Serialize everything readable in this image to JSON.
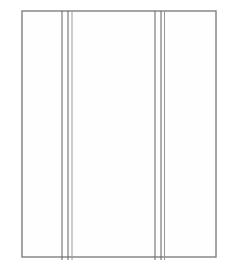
{
  "figure": {
    "background_color": "#ffffff",
    "width": 230,
    "height": 270
  },
  "palette": {
    "outline_stroke": "#7f7f7f",
    "seam_stroke": "#6e6e6e",
    "seam_stroke_soft": "#9a9a9a",
    "panel_fill": "#fefefe"
  },
  "outline": {
    "name": "panel-border",
    "x": 22,
    "y": 11,
    "width": 194,
    "height": 246,
    "stroke_width": 1.4
  },
  "seam_groups": [
    {
      "name": "left-seam-group",
      "label": "left",
      "lines": [
        {
          "x": 62.0,
          "y1": 11,
          "y2": 260,
          "weight": "strong"
        },
        {
          "x": 68.0,
          "y1": 11,
          "y2": 260,
          "weight": "strong"
        },
        {
          "x": 72.0,
          "y1": 11,
          "y2": 260,
          "weight": "soft"
        }
      ]
    },
    {
      "name": "right-seam-group",
      "label": "right",
      "lines": [
        {
          "x": 155.0,
          "y1": 11,
          "y2": 260,
          "weight": "strong"
        },
        {
          "x": 161.0,
          "y1": 11,
          "y2": 260,
          "weight": "strong"
        },
        {
          "x": 164.5,
          "y1": 11,
          "y2": 260,
          "weight": "soft"
        }
      ]
    }
  ]
}
